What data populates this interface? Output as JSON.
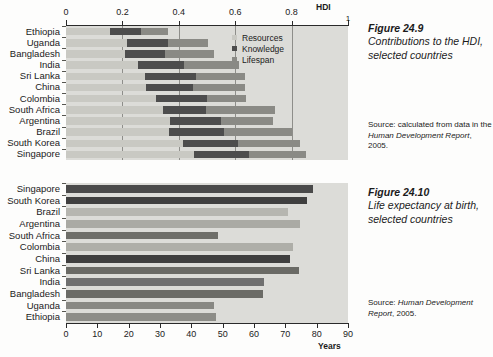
{
  "figure_hdi": {
    "caption_title": "Figure 24.9",
    "caption_body": "Contributions to the HDI, selected countries",
    "source_prefix": "Source: calculated from data in the ",
    "source_em": "Human Development Report",
    "source_suffix": ", 2005.",
    "legend": [
      {
        "label": "Resources",
        "color": "#c9c9c3"
      },
      {
        "label": "Knowledge",
        "color": "#4d4d4d"
      },
      {
        "label": "Lifespan",
        "color": "#8a8a85"
      }
    ]
  },
  "figure_life": {
    "caption_title": "Figure 24.10",
    "caption_body": "Life expectancy at birth, selected countries",
    "source_prefix": "Source: ",
    "source_em": "Human Development Report",
    "source_suffix": ", 2005."
  },
  "chart_data": [
    {
      "type": "bar",
      "id": "hdi",
      "orientation": "horizontal",
      "stacked": true,
      "title": "Contributions to the HDI, selected countries",
      "xlabel": "HDI",
      "ylabel": "",
      "xlim": [
        0,
        1
      ],
      "xticks": [
        0,
        0.2,
        0.4,
        0.6,
        0.8,
        1
      ],
      "xticklabels": [
        "0",
        "0.2",
        "0.4",
        "0.6",
        "0.8",
        "1"
      ],
      "grid": true,
      "legend": [
        "Resources",
        "Knowledge",
        "Lifespan"
      ],
      "legend_position": "upper right inside",
      "categories": [
        "Ethiopia",
        "Uganda",
        "Bangladesh",
        "India",
        "Sri Lanka",
        "China",
        "Colombia",
        "South Africa",
        "Argentina",
        "Brazil",
        "South Korea",
        "Singapore"
      ],
      "series": [
        {
          "name": "Resources",
          "color": "#c9c9c3",
          "values": [
            0.155,
            0.215,
            0.21,
            0.255,
            0.28,
            0.285,
            0.32,
            0.345,
            0.37,
            0.365,
            0.415,
            0.455
          ]
        },
        {
          "name": "Knowledge",
          "color": "#4d4d4d",
          "values": [
            0.11,
            0.145,
            0.14,
            0.165,
            0.18,
            0.165,
            0.18,
            0.15,
            0.18,
            0.195,
            0.195,
            0.195
          ]
        },
        {
          "name": "Lifespan",
          "color": "#8a8a85",
          "values": [
            0.095,
            0.145,
            0.175,
            0.195,
            0.175,
            0.185,
            0.14,
            0.245,
            0.185,
            0.24,
            0.22,
            0.2
          ]
        }
      ],
      "totals": [
        0.36,
        0.505,
        0.525,
        0.615,
        0.635,
        0.635,
        0.64,
        0.74,
        0.735,
        0.8,
        0.83,
        0.85
      ]
    },
    {
      "type": "bar",
      "id": "life_expectancy",
      "orientation": "horizontal",
      "stacked": false,
      "title": "Life expectancy at birth, selected countries",
      "xlabel": "Years",
      "ylabel": "",
      "xlim": [
        0,
        90
      ],
      "xticks": [
        0,
        10,
        20,
        30,
        40,
        50,
        60,
        70,
        80,
        90
      ],
      "xticklabels": [
        "0",
        "10",
        "20",
        "30",
        "40",
        "50",
        "60",
        "70",
        "80",
        "90"
      ],
      "grid": false,
      "categories": [
        "Singapore",
        "South Korea",
        "Brazil",
        "Argentina",
        "South Africa",
        "Colombia",
        "China",
        "Sri Lanka",
        "India",
        "Bangladesh",
        "Uganda",
        "Ethiopia"
      ],
      "values": [
        78.7,
        77.0,
        70.8,
        74.8,
        48.4,
        72.6,
        71.6,
        74.3,
        63.3,
        62.8,
        47.3,
        47.8
      ],
      "bar_colors": [
        "#4a4a4a",
        "#3f3f3f",
        "#b6b6b0",
        "#aaaaa4",
        "#6e6e69",
        "#aeaea8",
        "#3f3f3f",
        "#6a6a65",
        "#707070",
        "#6b6b66",
        "#888883",
        "#8d8d88"
      ]
    }
  ]
}
